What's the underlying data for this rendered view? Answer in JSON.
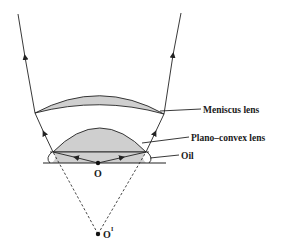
{
  "diagram": {
    "type": "optics-ray-diagram",
    "labels": {
      "meniscus": "Meniscus lens",
      "plano_convex": "Plano–convex lens",
      "oil": "Oil",
      "point_o": "O",
      "point_o_prime": "O",
      "point_o_prime_sup": "I"
    },
    "colors": {
      "line": "#222222",
      "lens_fill": "#cfcfcf",
      "background": "#ffffff"
    },
    "points": {
      "O": [
        98,
        163
      ],
      "O_prime": [
        98,
        234
      ]
    }
  }
}
